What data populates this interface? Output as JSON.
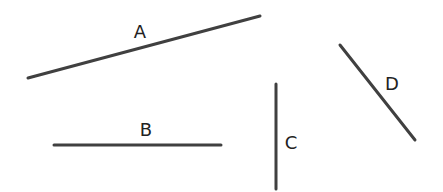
{
  "diagram": {
    "stroke_color": "#404040",
    "stroke_width": 3,
    "label_color": "#222222",
    "segments": [
      {
        "id": "A",
        "label": "A",
        "x1": 28,
        "y1": 78,
        "x2": 260,
        "y2": 16,
        "label_x": 140,
        "label_y": 38
      },
      {
        "id": "B",
        "label": "B",
        "x1": 54,
        "y1": 145,
        "x2": 221,
        "y2": 145,
        "label_x": 146,
        "label_y": 136
      },
      {
        "id": "C",
        "label": "C",
        "x1": 276,
        "y1": 84,
        "x2": 276,
        "y2": 189,
        "label_x": 291,
        "label_y": 149
      },
      {
        "id": "D",
        "label": "D",
        "x1": 340,
        "y1": 45,
        "x2": 415,
        "y2": 140,
        "label_x": 392,
        "label_y": 90
      }
    ]
  }
}
